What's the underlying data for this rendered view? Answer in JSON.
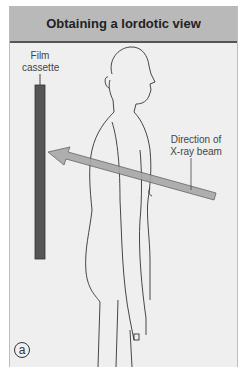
{
  "header": {
    "title": "Obtaining a lordotic view"
  },
  "labels": {
    "film_cassette": [
      "Film",
      "cassette"
    ],
    "xray_beam": [
      "Direction of",
      "X-ray beam"
    ]
  },
  "panel": {
    "letter": "a"
  },
  "colors": {
    "header_bg": "#b9b9b9",
    "background": "#efefef",
    "cassette": "#555555",
    "beam": "#a8a8a8",
    "outline": "#333333"
  }
}
